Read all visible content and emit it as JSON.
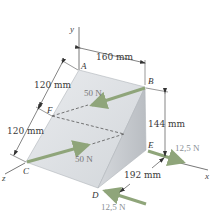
{
  "diagram": {
    "type": "3d-statics-wedge",
    "axes": {
      "x": "x",
      "y": "y",
      "z": "z"
    },
    "points": {
      "A": "A",
      "B": "B",
      "C": "C",
      "D": "D",
      "E": "E",
      "F": "F"
    },
    "dimensions": {
      "ab": "160 mm",
      "af": "120 mm",
      "fc": "120 mm",
      "be": "144 mm",
      "ed": "192 mm"
    },
    "forces": {
      "top": "50 N",
      "bottom": "50 N",
      "at_e": "12,5 N",
      "at_d": "12,5 N"
    },
    "colors": {
      "arrow": "#8fa57a",
      "face_left": "#dcdfe3",
      "face_right": "#c4c8cc",
      "edge": "#9aa0a6",
      "dim_line": "#333333"
    }
  }
}
